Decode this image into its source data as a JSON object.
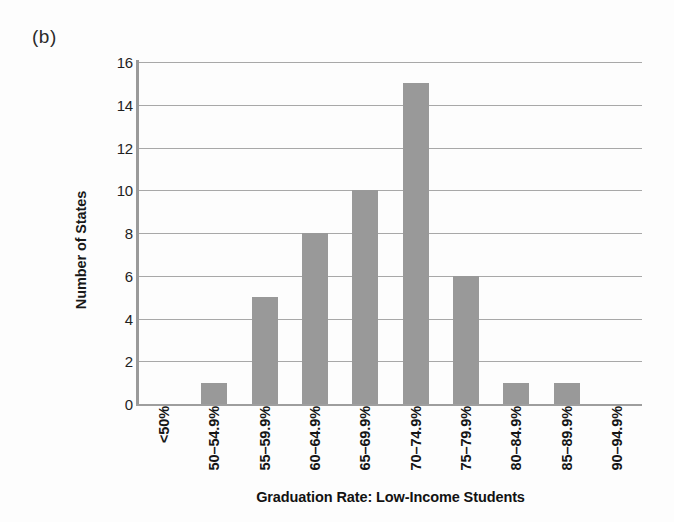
{
  "figure": {
    "panel_label": "(b)",
    "background_color": "#fdfdfd"
  },
  "chart_data": {
    "type": "bar",
    "title": "",
    "subtitle": "",
    "panel": "(b)",
    "xlabel": "Graduation Rate: Low-Income Students",
    "ylabel": "Number of States",
    "categories": [
      "<50%",
      "50–54.9%",
      "55–59.9%",
      "60–64.9%",
      "65–69.9%",
      "70–74.9%",
      "75–79.9%",
      "80–84.9%",
      "85–89.9%",
      "90–94.9%"
    ],
    "values": [
      0,
      1,
      5,
      8,
      10,
      15,
      6,
      1,
      1,
      0
    ],
    "ylim": [
      0,
      16
    ],
    "ytick_labels": [
      "0",
      "2",
      "4",
      "6",
      "8",
      "10",
      "12",
      "14",
      "16"
    ],
    "ytick_values": [
      0,
      2,
      4,
      6,
      8,
      10,
      12,
      14,
      16
    ],
    "grid": "horizontal",
    "legend": "none",
    "bar_color": "#999999",
    "gridline_color": "#a8a8a8",
    "axis_color": "#9a9a9a",
    "annotations": []
  }
}
